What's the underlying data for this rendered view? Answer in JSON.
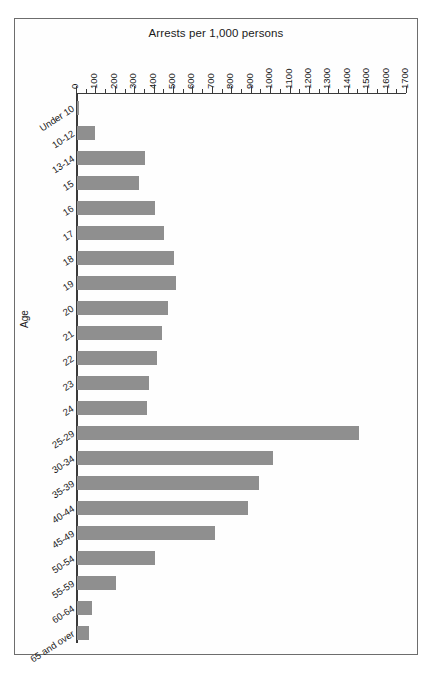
{
  "chart_data": {
    "type": "bar",
    "orientation": "horizontal",
    "title": "Arrests per 1,000 persons",
    "xlabel": "Arrests per 1,000 persons",
    "ylabel": "Age",
    "xlim": [
      0,
      1700
    ],
    "xtick_step": 100,
    "minor_tick_step": 50,
    "grid": false,
    "legend": null,
    "bar_color": "#8f8f8f",
    "axis_color": "#3a3a3a",
    "frame_color": "#6d6d6d",
    "xticks": [
      "0",
      "100",
      "200",
      "300",
      "400",
      "500",
      "600",
      "700",
      "800",
      "900",
      "1000",
      "1100",
      "1200",
      "1300",
      "1400",
      "1500",
      "1600",
      "1700"
    ],
    "categories": [
      "Under 10",
      "10-12",
      "13-14",
      "15",
      "16",
      "17",
      "18",
      "19",
      "20",
      "21",
      "22",
      "23",
      "24",
      "25-29",
      "30-34",
      "35-39",
      "40-44",
      "45-49",
      "50-54",
      "55-59",
      "60-64",
      "65 and over"
    ],
    "values": [
      5,
      95,
      350,
      320,
      400,
      450,
      500,
      510,
      470,
      440,
      410,
      370,
      360,
      1455,
      1010,
      940,
      880,
      710,
      400,
      200,
      75,
      60
    ]
  }
}
